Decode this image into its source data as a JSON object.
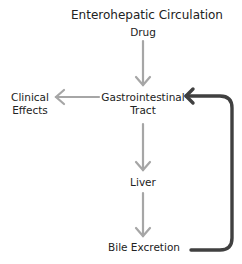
{
  "title": "Enterohepatic Circulation",
  "nodes": {
    "drug": "Drug",
    "gi_line1": "Gastrointestinal",
    "gi_line2": "Tract",
    "clinical_line1": "Clinical",
    "clinical_line2": "Effects",
    "liver": "Liver",
    "bile": "Bile Excretion"
  },
  "colors": {
    "arrow_light": "#a6a6a6",
    "arrow_dark": "#404040",
    "text": "#222222"
  }
}
